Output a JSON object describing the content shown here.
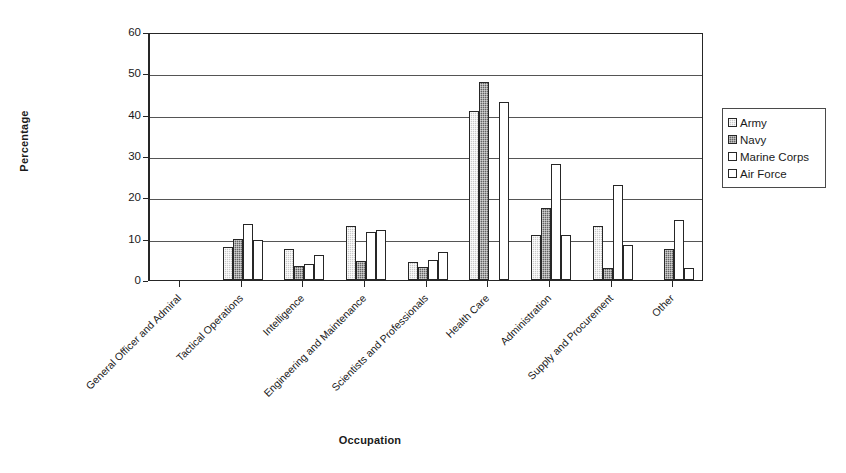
{
  "chart_data": {
    "type": "bar",
    "title": "",
    "subtitle": "",
    "xlabel": "Occupation",
    "ylabel": "Percentage",
    "ylim": [
      0,
      60
    ],
    "yticks": [
      0,
      10,
      20,
      30,
      40,
      50,
      60
    ],
    "grid": true,
    "legend_position": "right",
    "categories": [
      "General Officer and Admiral",
      "Tactical Operations",
      "Intelligence",
      "Engineering and Maintenance",
      "Scientists and Professionals",
      "Health Care",
      "Administration",
      "Supply and Procurement",
      "Other"
    ],
    "series": [
      {
        "name": "Army",
        "fill": "light-gray-dotted",
        "color": "#c9c9c9",
        "values": [
          0,
          8,
          7.5,
          13,
          4.3,
          41,
          11,
          13,
          0
        ]
      },
      {
        "name": "Navy",
        "fill": "dark-gray-dotted",
        "color": "#636363",
        "values": [
          0,
          10,
          3.5,
          4.7,
          3.2,
          48,
          17.5,
          3,
          7.5
        ]
      },
      {
        "name": "Marine Corps",
        "fill": "white",
        "color": "#ffffff",
        "values": [
          0,
          13.5,
          3.8,
          11.5,
          4.8,
          0,
          28,
          23,
          14.5
        ]
      },
      {
        "name": "Air Force",
        "fill": "white",
        "color": "#ffffff",
        "values": [
          0,
          9.8,
          6,
          12,
          6.7,
          43,
          11,
          8.5,
          2.8
        ]
      }
    ]
  },
  "axes": {
    "y_title": "Percentage",
    "x_title": "Occupation"
  }
}
